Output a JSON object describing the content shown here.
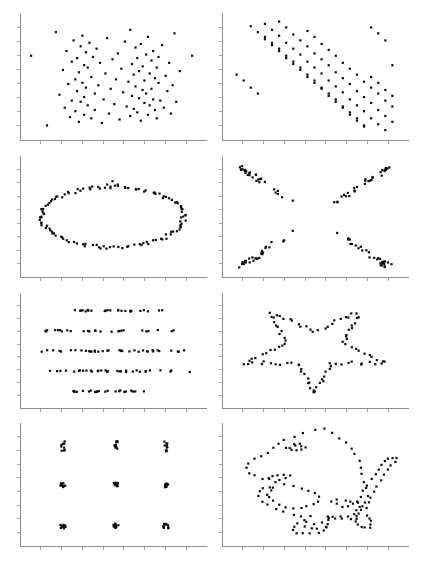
{
  "figure": {
    "layout": {
      "rows": 4,
      "cols": 2,
      "width": 423,
      "height": 569
    },
    "background_color": "#ffffff",
    "point_color": "#0d0d0d",
    "axis_color": "#8d8d8d",
    "point_size_px": 2.2,
    "axis_style": "L-shaped spine with outward tick marks, no tick labels"
  },
  "chart_data": [
    {
      "id": "panel-random",
      "name": "random-scatter",
      "type": "scatter",
      "title": "",
      "xlabel": "",
      "ylabel": "",
      "xlim": [
        0,
        100
      ],
      "ylim": [
        0,
        100
      ],
      "grid": false,
      "legend": "none",
      "ticks": {
        "x": 8,
        "y": 8,
        "labels": false
      },
      "x": [
        4,
        13,
        18,
        20,
        22,
        23,
        24,
        25,
        26,
        27,
        27,
        28,
        29,
        29,
        30,
        30,
        31,
        31,
        32,
        32,
        33,
        33,
        34,
        34,
        34,
        35,
        35,
        36,
        36,
        37,
        38,
        38,
        39,
        40,
        40,
        41,
        42,
        43,
        44,
        45,
        46,
        47,
        48,
        49,
        50,
        51,
        52,
        53,
        54,
        55,
        56,
        57,
        58,
        59,
        60,
        60,
        61,
        61,
        62,
        62,
        63,
        63,
        64,
        64,
        65,
        65,
        66,
        66,
        67,
        67,
        68,
        68,
        69,
        69,
        70,
        70,
        71,
        71,
        72,
        72,
        73,
        73,
        74,
        74,
        75,
        75,
        76,
        76,
        77,
        78,
        79,
        80,
        81,
        82,
        83,
        84,
        85,
        86,
        88,
        95
      ],
      "y": [
        68,
        9,
        88,
        35,
        56,
        24,
        72,
        44,
        16,
        63,
        30,
        81,
        48,
        21,
        66,
        38,
        12,
        54,
        76,
        29,
        45,
        85,
        18,
        60,
        33,
        71,
        41,
        26,
        58,
        79,
        15,
        50,
        67,
        36,
        22,
        74,
        43,
        62,
        11,
        31,
        53,
        83,
        19,
        40,
        65,
        27,
        48,
        70,
        14,
        57,
        37,
        80,
        25,
        46,
        90,
        17,
        61,
        34,
        52,
        23,
        75,
        42,
        66,
        20,
        55,
        32,
        78,
        13,
        59,
        39,
        47,
        28,
        69,
        36,
        84,
        18,
        53,
        26,
        64,
        40,
        31,
        72,
        22,
        49,
        58,
        15,
        45,
        67,
        30,
        77,
        24,
        51,
        38,
        62,
        19,
        43,
        87,
        29,
        55,
        68
      ]
    },
    {
      "id": "panel-slant",
      "name": "parallel-diagonal-stripes",
      "type": "scatter",
      "title": "",
      "xlabel": "",
      "ylabel": "",
      "xlim": [
        0,
        100
      ],
      "ylim": [
        0,
        100
      ],
      "grid": false,
      "legend": "none",
      "ticks": {
        "x": 8,
        "y": 8,
        "labels": false
      },
      "stripes": 5,
      "slope": -1.35,
      "x": [
        6,
        10,
        14,
        18,
        22,
        26,
        30,
        34,
        38,
        42,
        46,
        50,
        54,
        58,
        62,
        66,
        70,
        74,
        78,
        82,
        86,
        90,
        14,
        18,
        22,
        26,
        30,
        34,
        38,
        42,
        46,
        50,
        54,
        58,
        62,
        66,
        70,
        74,
        78,
        82,
        86,
        90,
        94,
        22,
        26,
        30,
        34,
        38,
        42,
        46,
        50,
        54,
        58,
        62,
        66,
        70,
        74,
        78,
        82,
        86,
        90,
        94,
        30,
        34,
        38,
        42,
        46,
        50,
        54,
        58,
        62,
        66,
        70,
        74,
        78,
        82,
        86,
        90,
        94,
        46,
        50,
        54,
        58,
        62,
        66,
        70,
        74,
        78,
        82,
        86,
        90,
        94
      ],
      "y": [
        52,
        47,
        41,
        36,
        84,
        79,
        74,
        68,
        63,
        58,
        52,
        47,
        41,
        36,
        31,
        25,
        20,
        15,
        9,
        92,
        87,
        81,
        93,
        88,
        82,
        77,
        72,
        66,
        61,
        56,
        50,
        45,
        40,
        34,
        29,
        24,
        18,
        13,
        8,
        50,
        45,
        39,
        34,
        95,
        90,
        85,
        79,
        74,
        69,
        63,
        58,
        53,
        47,
        42,
        37,
        31,
        26,
        21,
        15,
        10,
        5,
        60,
        97,
        92,
        86,
        81,
        76,
        70,
        65,
        60,
        54,
        49,
        44,
        38,
        33,
        28,
        22,
        17,
        12,
        89,
        84,
        78,
        73,
        68,
        62,
        57,
        52,
        46,
        41,
        36,
        30,
        25
      ]
    },
    {
      "id": "panel-ellipse",
      "name": "ellipse-outline",
      "type": "scatter",
      "title": "",
      "xlabel": "",
      "ylabel": "",
      "xlim": [
        0,
        100
      ],
      "ylim": [
        0,
        100
      ],
      "grid": false,
      "legend": "none",
      "ticks": {
        "x": 8,
        "y": 8,
        "labels": false
      },
      "shape": "ellipse",
      "center": [
        50,
        50
      ],
      "radius_x": 40,
      "radius_y": 27,
      "n_points": 120
    },
    {
      "id": "panel-cross",
      "name": "x-cross",
      "type": "scatter",
      "title": "",
      "xlabel": "",
      "ylabel": "",
      "xlim": [
        0,
        100
      ],
      "ylim": [
        0,
        100
      ],
      "grid": false,
      "legend": "none",
      "ticks": {
        "x": 8,
        "y": 8,
        "labels": false
      },
      "shape": "x-cross",
      "center": [
        50,
        50
      ],
      "arm_length": 45,
      "n_points": 120
    },
    {
      "id": "panel-hlines",
      "name": "five-horizontal-bands",
      "type": "scatter",
      "title": "",
      "xlabel": "",
      "ylabel": "",
      "xlim": [
        0,
        100
      ],
      "ylim": [
        0,
        100
      ],
      "grid": false,
      "legend": "none",
      "ticks": {
        "x": 8,
        "y": 8,
        "labels": false
      },
      "shape": "horizontal-lines",
      "band_y_values": [
        88,
        69,
        50,
        31,
        12
      ],
      "n_points": 140
    },
    {
      "id": "panel-star",
      "name": "five-point-star",
      "type": "scatter",
      "title": "",
      "xlabel": "",
      "ylabel": "",
      "xlim": [
        0,
        100
      ],
      "ylim": [
        0,
        100
      ],
      "grid": false,
      "legend": "none",
      "ticks": {
        "x": 8,
        "y": 8,
        "labels": false
      },
      "shape": "star",
      "center": [
        50,
        52
      ],
      "outer_radius": 42,
      "inner_radius": 17,
      "n_points": 95
    },
    {
      "id": "panel-dots",
      "name": "nine-cluster-grid",
      "type": "scatter",
      "title": "",
      "xlabel": "",
      "ylabel": "",
      "xlim": [
        0,
        100
      ],
      "ylim": [
        0,
        100
      ],
      "grid": false,
      "legend": "none",
      "ticks": {
        "x": 8,
        "y": 8,
        "labels": false
      },
      "shape": "cluster-grid",
      "cluster_centers_x": [
        22,
        52,
        80
      ],
      "cluster_centers_y": [
        84,
        50,
        14
      ],
      "n_points": 90
    },
    {
      "id": "panel-dino",
      "name": "datasaurus-dinosaur",
      "type": "scatter",
      "title": "",
      "xlabel": "",
      "ylabel": "",
      "xlim": [
        0,
        100
      ],
      "ylim": [
        0,
        100
      ],
      "grid": false,
      "legend": "none",
      "ticks": {
        "x": 8,
        "y": 8,
        "labels": false
      },
      "shape": "dinosaur",
      "n_points": 142
    }
  ]
}
